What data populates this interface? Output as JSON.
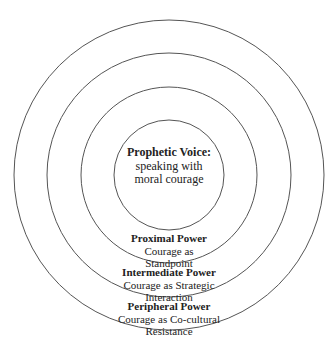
{
  "diagram": {
    "type": "concentric-circles",
    "ring_color": "#555555",
    "center": {
      "title": "Prophetic Voice:",
      "lines": [
        "speaking with",
        "moral courage"
      ]
    },
    "rings": [
      {
        "title": "Proximal Power",
        "lines": [
          "Courage as",
          "Standpoint"
        ]
      },
      {
        "title": "Intermediate Power",
        "lines": [
          "Courage as Strategic",
          "Interaction"
        ]
      },
      {
        "title": "Peripheral Power",
        "lines": [
          "Courage as Co-cultural",
          "Resistance"
        ]
      }
    ]
  }
}
